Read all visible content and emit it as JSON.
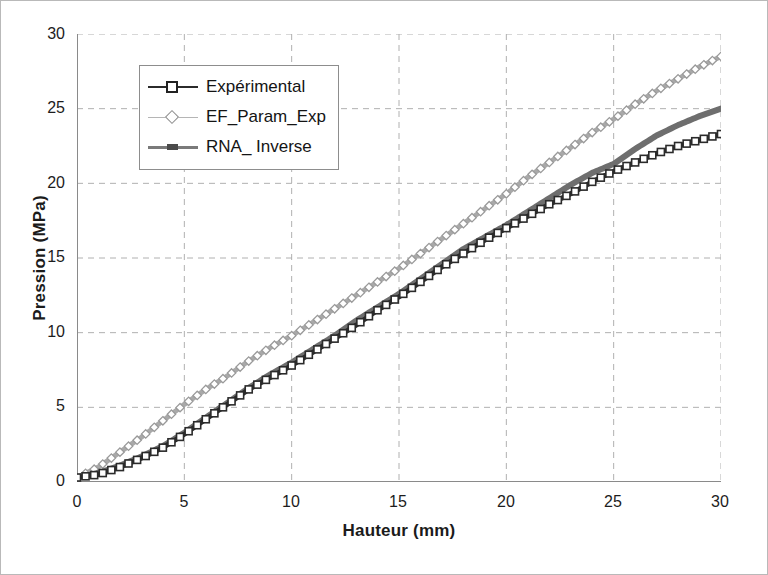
{
  "chart_data": {
    "type": "line",
    "title": "",
    "xlabel": "Hauteur (mm)",
    "ylabel": "Pression (MPa)",
    "xlim": [
      0,
      30
    ],
    "ylim": [
      0,
      30
    ],
    "xticks": [
      0,
      5,
      10,
      15,
      20,
      25,
      30
    ],
    "yticks": [
      0,
      5,
      10,
      15,
      20,
      25,
      30
    ],
    "grid": true,
    "legend_position": "upper left",
    "x": [
      0,
      1,
      2,
      3,
      4,
      5,
      6,
      7,
      8,
      9,
      10,
      11,
      12,
      13,
      14,
      15,
      16,
      17,
      18,
      19,
      20,
      21,
      22,
      23,
      24,
      25,
      26,
      27,
      28,
      29,
      30
    ],
    "series": [
      {
        "name": "Expérimental",
        "marker": "open-square",
        "color": "#2b2b2b",
        "values": [
          0.3,
          0.5,
          1.0,
          1.6,
          2.3,
          3.2,
          4.2,
          5.2,
          6.2,
          7.0,
          7.8,
          8.7,
          9.6,
          10.5,
          11.5,
          12.4,
          13.4,
          14.4,
          15.3,
          16.2,
          17.0,
          17.8,
          18.6,
          19.3,
          20.1,
          20.8,
          21.4,
          22.0,
          22.5,
          22.9,
          23.3
        ]
      },
      {
        "name": "EF_Param_Exp",
        "marker": "open-diamond",
        "color": "#a9a9a9",
        "values": [
          0.3,
          1.0,
          2.0,
          3.0,
          4.1,
          5.2,
          6.2,
          7.1,
          8.1,
          9.0,
          9.8,
          10.7,
          11.6,
          12.5,
          13.4,
          14.3,
          15.3,
          16.3,
          17.3,
          18.3,
          19.3,
          20.4,
          21.4,
          22.4,
          23.4,
          24.3,
          25.3,
          26.2,
          27.0,
          27.8,
          28.5
        ]
      },
      {
        "name": "RNA_ Inverse",
        "marker": "line",
        "color": "#6e6e6e",
        "values": [
          0.3,
          0.6,
          1.1,
          1.7,
          2.4,
          3.3,
          4.3,
          5.3,
          6.3,
          7.2,
          8.0,
          8.9,
          9.8,
          10.8,
          11.7,
          12.6,
          13.6,
          14.6,
          15.6,
          16.4,
          17.2,
          18.1,
          19.0,
          19.9,
          20.7,
          21.3,
          22.3,
          23.2,
          23.9,
          24.5,
          25.0
        ]
      }
    ]
  },
  "legend": {
    "items": [
      {
        "label": "Expérimental"
      },
      {
        "label": "EF_Param_Exp"
      },
      {
        "label": "RNA_ Inverse"
      }
    ]
  },
  "axes": {
    "x_title": "Hauteur (mm)",
    "y_title": "Pression (MPa)",
    "x_tick_labels": [
      "0",
      "5",
      "10",
      "15",
      "20",
      "25",
      "30"
    ],
    "y_tick_labels": [
      "0",
      "5",
      "10",
      "15",
      "20",
      "25",
      "30"
    ]
  },
  "colors": {
    "experimental": "#2b2b2b",
    "ef_param_exp": "#a9a9a9",
    "rna_inverse": "#6e6e6e",
    "grid": "#b0b0b0",
    "axis": "#8a8a8a",
    "text": "#1d1d1d",
    "frame": "#b9b9b9"
  }
}
